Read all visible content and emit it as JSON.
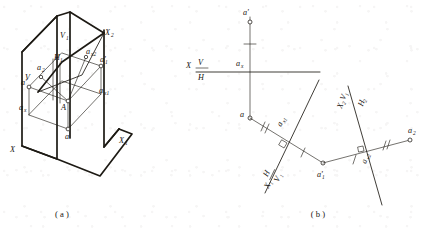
{
  "figure": {
    "title_captions": {
      "left": "( a )",
      "right": "( b )"
    },
    "panel_a": {
      "name": "pictorial-axonometric-projection",
      "labels": {
        "V": "V",
        "V1": "V",
        "V1_sub": "1",
        "X": "X",
        "X1": "X",
        "X1_sub": "1",
        "X2": "X",
        "X2_sub": "2",
        "H1": "H",
        "H1_sub": "1",
        "A": "A",
        "a": "a",
        "a_prime": "a'",
        "a_x": "a",
        "a_x_sub": "x",
        "a1_prime": "a'",
        "a1_prime_sub": "1",
        "a_x1": "a",
        "a_x1_sub": "x1",
        "a_x2": "a",
        "a_x2_sub": "x2",
        "a2": "a",
        "a2_sub": "2"
      }
    },
    "panel_b": {
      "name": "orthographic-multiview-projection",
      "labels": {
        "X": "X",
        "V_over_H_top": "V",
        "V_over_H_bottom": "H",
        "a_prime": "a'",
        "a": "a",
        "a_x": "a",
        "a_x_sub": "x",
        "a1_prime": "a'",
        "a1_prime_sub": "1",
        "a_x1": "a",
        "a_x1_sub": "x1",
        "a_x2": "a",
        "a_x2_sub": "x2",
        "a2": "a",
        "a2_sub": "2",
        "X1": "X",
        "X1_sub": "1",
        "H_over_V1_top": "H",
        "H_over_V1_bottom": "V",
        "H_over_V1_bottom_sub": "1",
        "X2": "X",
        "X2_sub": "2",
        "V1_label": "V",
        "V1_label_sub": "1",
        "H2_label": "H",
        "H2_label_sub": "2"
      }
    },
    "colors": {
      "ink": "#1d1a14",
      "paper": "#ffffff"
    }
  }
}
